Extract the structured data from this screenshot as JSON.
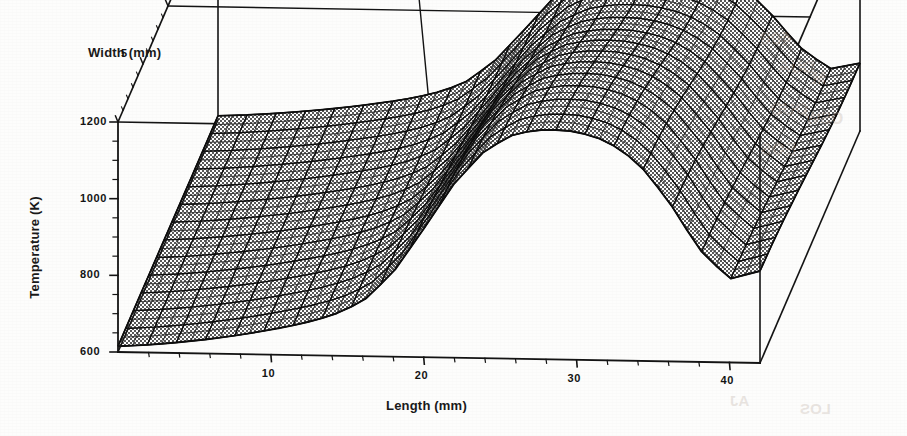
{
  "figure": {
    "width": 907,
    "height": 436,
    "background": "#fdfdfc",
    "line_color": "#141414",
    "mesh_fill": "#8f8f8f"
  },
  "axes": {
    "x": {
      "title": "Length (mm)",
      "ticks": [
        "10",
        "20",
        "30",
        "40"
      ],
      "tick_values": [
        10,
        20,
        30,
        40
      ],
      "range": [
        0,
        42
      ]
    },
    "y": {
      "title": "Width (mm)",
      "ticks": [
        "5",
        "10",
        "15",
        "20"
      ],
      "tick_values": [
        5,
        10,
        15,
        20
      ],
      "range": [
        0,
        20
      ]
    },
    "z": {
      "title": "Temperature (K)",
      "ticks": [
        "1200",
        "1000",
        "800",
        "600"
      ],
      "tick_values": [
        1200,
        1000,
        800,
        600
      ],
      "range": [
        600,
        1200
      ]
    }
  },
  "bleed": [
    {
      "text": "400",
      "left": 760,
      "top": 28,
      "size": 19
    },
    {
      "text": "DUA",
      "left": 778,
      "top": 58,
      "size": 17
    },
    {
      "text": "OUD",
      "left": 770,
      "top": 100,
      "size": 17
    },
    {
      "text": "EOS",
      "left": 760,
      "top": 140,
      "size": 17
    },
    {
      "text": "OSW",
      "left": 805,
      "top": 110,
      "size": 16
    },
    {
      "text": "M",
      "left": 812,
      "top": 70,
      "size": 16
    },
    {
      "text": "AJ",
      "left": 730,
      "top": 392,
      "size": 15
    },
    {
      "text": "LOS",
      "left": 800,
      "top": 400,
      "size": 15
    }
  ],
  "chart_data": {
    "type": "surface",
    "title": "",
    "xlabel": "Length (mm)",
    "ylabel": "Width (mm)",
    "zlabel": "Temperature (K)",
    "xlim": [
      0,
      42
    ],
    "ylim": [
      0,
      20
    ],
    "zlim": [
      600,
      1200
    ],
    "grid": true,
    "legend": "none",
    "colormap": "grayscale-dither",
    "x": [
      0,
      2,
      4,
      6,
      8,
      10,
      12,
      14,
      16,
      18,
      20,
      22,
      24,
      26,
      28,
      30,
      32,
      34,
      36,
      38,
      40,
      42
    ],
    "y": [
      0,
      2.5,
      5,
      7.5,
      10,
      12.5,
      15,
      17.5,
      20
    ],
    "z_profile_centerline": [
      615,
      620,
      628,
      638,
      650,
      665,
      682,
      705,
      742,
      820,
      935,
      1055,
      1142,
      1188,
      1200,
      1196,
      1172,
      1118,
      1020,
      895,
      818,
      840
    ],
    "z_width_falloff": [
      1.0,
      0.985,
      0.955,
      0.912,
      0.862,
      0.812,
      0.772,
      0.748,
      0.738
    ],
    "notes": {
      "peak_temperature": 1200,
      "peak_length_mm": 28,
      "baseline_temperature": 615,
      "steep_rise_start_mm": 16
    }
  }
}
